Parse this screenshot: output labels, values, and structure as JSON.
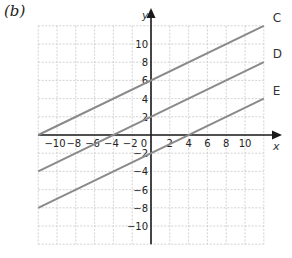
{
  "figure": {
    "sublabel": "(b)"
  },
  "chart_data": {
    "type": "line",
    "title": "",
    "xlabel": "x",
    "ylabel": "y",
    "xlim": [
      -12,
      12
    ],
    "ylim": [
      -12,
      12
    ],
    "grid": true,
    "grid_style": "dashed",
    "grid_step": 2,
    "x_ticks": [
      -10,
      -8,
      -6,
      -4,
      -2,
      0,
      2,
      4,
      6,
      8,
      10
    ],
    "y_ticks": [
      10,
      8,
      6,
      4,
      2,
      -2,
      -4,
      -6,
      -8,
      -10
    ],
    "origin_label": "0",
    "series": [
      {
        "name": "C",
        "x": [
          -12,
          12
        ],
        "y": [
          0,
          12
        ],
        "equation": "y = x/2 + 6"
      },
      {
        "name": "D",
        "x": [
          -12,
          12
        ],
        "y": [
          -4,
          8
        ],
        "equation": "y = x/2 + 2"
      },
      {
        "name": "E",
        "x": [
          -12,
          12
        ],
        "y": [
          -8,
          4
        ],
        "equation": "y = x/2 - 2"
      }
    ],
    "line_color": "#8a8a8a",
    "axis_color": "#1a1a1a",
    "grid_color": "#c8c8c8"
  }
}
